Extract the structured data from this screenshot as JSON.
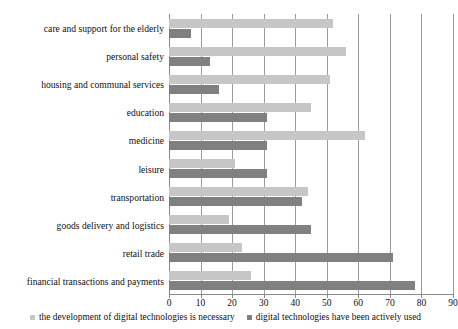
{
  "chart_data": {
    "type": "bar",
    "orientation": "horizontal",
    "title": "",
    "xlabel": "",
    "ylabel": "",
    "xlim": [
      0,
      90
    ],
    "xticks": [
      0,
      10,
      20,
      30,
      40,
      50,
      60,
      70,
      80,
      90
    ],
    "grid": true,
    "legend_position": "bottom",
    "categories": [
      "care and support for the elderly",
      "personal safety",
      "housing and communal services",
      "education",
      "medicine",
      "leisure",
      "transportation",
      "goods delivery and logistics",
      "retail trade",
      "financial transactions and payments"
    ],
    "series": [
      {
        "name": "the development of digital technologies is necessary",
        "color": "#c6c6c6",
        "values": [
          52,
          56,
          51,
          45,
          62,
          21,
          44,
          19,
          23,
          26
        ]
      },
      {
        "name": "digital technologies have been actively used",
        "color": "#808080",
        "values": [
          7,
          13,
          16,
          31,
          31,
          31,
          42,
          45,
          71,
          78
        ]
      }
    ]
  },
  "legend": {
    "items": [
      {
        "label": "the development of digital technologies is necessary",
        "marker": "square-marker"
      },
      {
        "label": "digital technologies have been actively used",
        "marker": "square-marker"
      }
    ]
  }
}
